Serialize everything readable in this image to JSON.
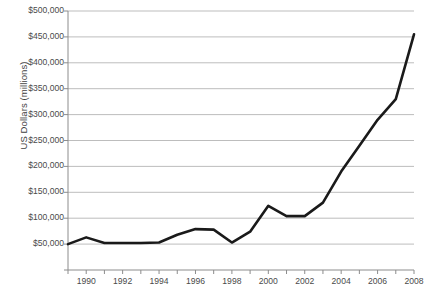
{
  "chart_data": {
    "type": "line",
    "title": "",
    "xlabel": "",
    "ylabel": "US Dollars (millions)",
    "x": [
      1989,
      1990,
      1991,
      1992,
      1993,
      1994,
      1995,
      1996,
      1997,
      1998,
      1999,
      2000,
      2001,
      2002,
      2003,
      2004,
      2005,
      2006,
      2007,
      2008
    ],
    "values": [
      50000,
      63000,
      52000,
      52000,
      52000,
      53000,
      68000,
      79000,
      78000,
      53000,
      74000,
      124000,
      104000,
      104000,
      130000,
      190000,
      240000,
      290000,
      330000,
      455000
    ],
    "series": [
      {
        "name": "US Dollars (millions)",
        "values": [
          50000,
          63000,
          52000,
          52000,
          52000,
          53000,
          68000,
          79000,
          78000,
          53000,
          74000,
          124000,
          104000,
          104000,
          130000,
          190000,
          240000,
          290000,
          330000,
          455000
        ],
        "color": "#1a1a1a"
      }
    ],
    "xlim": [
      1989,
      2008
    ],
    "ylim": [
      0,
      500000
    ],
    "y_ticks": [
      0,
      50000,
      100000,
      150000,
      200000,
      250000,
      300000,
      350000,
      400000,
      450000,
      500000
    ],
    "y_tick_labels": [
      "",
      "$50,000",
      "$100,000",
      "$150,000",
      "$200,000",
      "$250,000",
      "$300,000",
      "$350,000",
      "$400,000",
      "$450,000",
      "$500,000"
    ],
    "x_ticks": [
      1989,
      1990,
      1991,
      1992,
      1993,
      1994,
      1995,
      1996,
      1997,
      1998,
      1999,
      2000,
      2001,
      2002,
      2003,
      2004,
      2005,
      2006,
      2007,
      2008
    ],
    "x_tick_labels": [
      "",
      "1990",
      "",
      "1992",
      "",
      "1994",
      "",
      "1996",
      "",
      "1998",
      "",
      "2000",
      "",
      "2002",
      "",
      "2004",
      "",
      "2006",
      "",
      "2008"
    ],
    "grid": "horizontal",
    "legend": "none",
    "grid_color": "#b5b5b5",
    "axis_color": "#8c8c8c",
    "plot_background": "#ffffff"
  },
  "plot_geometry": {
    "left": 68,
    "right": 414,
    "top": 11,
    "bottom": 270
  }
}
